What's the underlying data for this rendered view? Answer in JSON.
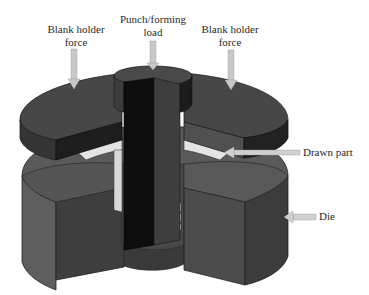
{
  "figure": {
    "labels": {
      "blank_holder_left_line1": "Blank holder",
      "blank_holder_left_line2": "force",
      "punch_line1": "Punch/forming",
      "punch_line2": "load",
      "blank_holder_right_line1": "Blank holder",
      "blank_holder_right_line2": "force",
      "drawn_part": "Drawn part",
      "die": "Die"
    },
    "components": [
      "blank holder (left half)",
      "blank holder (right half)",
      "punch",
      "drawn part",
      "die"
    ],
    "arrows": [
      {
        "name": "blank-holder-force-left",
        "direction": "down"
      },
      {
        "name": "punch-load",
        "direction": "down"
      },
      {
        "name": "blank-holder-force-right",
        "direction": "down"
      },
      {
        "name": "drawn-part-pointer",
        "direction": "left"
      },
      {
        "name": "die-pointer",
        "direction": "left"
      }
    ],
    "colors": {
      "background": "#ffffff",
      "top_face": "#4a4a4a",
      "side_light": "#5c5c5c",
      "side_dark": "#2e2e2e",
      "punch_dark": "#111111",
      "punch_face": "#404040",
      "die_top": "#5a5a5a",
      "die_side": "#555555",
      "die_cut": "#3c3c3c",
      "sheet": "#e6e6e6",
      "arrow": "#c8c8c8",
      "text": "#2a2a2a"
    }
  }
}
